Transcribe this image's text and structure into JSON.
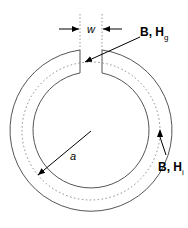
{
  "diagram": {
    "labels": {
      "gap_width": "w",
      "radius": "a",
      "gap_field": "B, H",
      "gap_field_sub": "g",
      "core_field": "B, H",
      "core_field_sub": "i"
    },
    "colors": {
      "stroke": "#555555",
      "dotted": "#888888",
      "text": "#000000"
    }
  }
}
